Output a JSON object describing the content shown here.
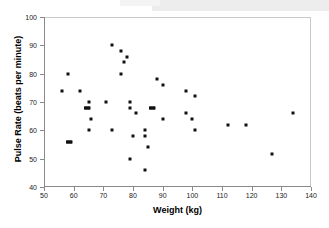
{
  "figure": {
    "background_color": "#ffffff",
    "marker_color": "#101010",
    "axis_color": "#8a8a8a"
  },
  "chart_data": {
    "type": "scatter",
    "title": "",
    "xlabel": "Weight (kg)",
    "ylabel": "Pulse Rate (beats per minute)",
    "xlim": [
      50,
      140
    ],
    "ylim": [
      40,
      100
    ],
    "xticks": [
      50,
      60,
      70,
      80,
      90,
      100,
      110,
      120,
      130,
      140
    ],
    "yticks": [
      40,
      50,
      60,
      70,
      80,
      90,
      100
    ],
    "grid": false,
    "legend": null,
    "x": [
      56,
      58,
      58,
      59,
      62,
      64,
      64,
      65,
      65,
      66,
      66,
      71,
      73,
      73,
      76,
      76,
      77,
      78,
      78,
      79,
      79,
      80,
      80,
      82,
      84,
      84,
      84,
      85,
      86,
      87,
      88,
      88,
      90,
      90,
      98,
      98,
      100,
      101,
      101,
      112,
      118,
      127,
      134
    ],
    "y": [
      74,
      80,
      56,
      56,
      74,
      68,
      68,
      70,
      60,
      64,
      68,
      70,
      90,
      60,
      88,
      80,
      84,
      86,
      70,
      68,
      50,
      58,
      66,
      60,
      58,
      54,
      46,
      60,
      68,
      68,
      76,
      68,
      64,
      76,
      74,
      66,
      64,
      72,
      60,
      62,
      62,
      51.5,
      66
    ],
    "points": [
      {
        "x": 56,
        "y": 74
      },
      {
        "x": 58,
        "y": 80
      },
      {
        "x": 58,
        "y": 56
      },
      {
        "x": 59,
        "y": 56
      },
      {
        "x": 62,
        "y": 74
      },
      {
        "x": 64,
        "y": 68
      },
      {
        "x": 65,
        "y": 68
      },
      {
        "x": 65,
        "y": 70
      },
      {
        "x": 65,
        "y": 60
      },
      {
        "x": 66,
        "y": 64
      },
      {
        "x": 71,
        "y": 70
      },
      {
        "x": 73,
        "y": 90
      },
      {
        "x": 73,
        "y": 60
      },
      {
        "x": 76,
        "y": 88
      },
      {
        "x": 76,
        "y": 80
      },
      {
        "x": 77,
        "y": 84
      },
      {
        "x": 78,
        "y": 86
      },
      {
        "x": 79,
        "y": 70
      },
      {
        "x": 79,
        "y": 68
      },
      {
        "x": 79,
        "y": 50
      },
      {
        "x": 80,
        "y": 58
      },
      {
        "x": 81,
        "y": 66
      },
      {
        "x": 84,
        "y": 60
      },
      {
        "x": 84,
        "y": 58
      },
      {
        "x": 85,
        "y": 54
      },
      {
        "x": 84,
        "y": 46
      },
      {
        "x": 86,
        "y": 68
      },
      {
        "x": 87,
        "y": 68
      },
      {
        "x": 88,
        "y": 78
      },
      {
        "x": 90,
        "y": 64
      },
      {
        "x": 90,
        "y": 76
      },
      {
        "x": 98,
        "y": 74
      },
      {
        "x": 98,
        "y": 66
      },
      {
        "x": 100,
        "y": 64
      },
      {
        "x": 101,
        "y": 72
      },
      {
        "x": 101,
        "y": 60
      },
      {
        "x": 112,
        "y": 62
      },
      {
        "x": 118,
        "y": 62
      },
      {
        "x": 127,
        "y": 51.5
      },
      {
        "x": 134,
        "y": 66
      }
    ],
    "overlapping_pairs": [
      {
        "x": 58.5,
        "y": 56,
        "note": "two coincident markers"
      },
      {
        "x": 64.5,
        "y": 68,
        "note": "two coincident markers"
      },
      {
        "x": 86.5,
        "y": 68,
        "note": "two coincident markers"
      }
    ]
  }
}
